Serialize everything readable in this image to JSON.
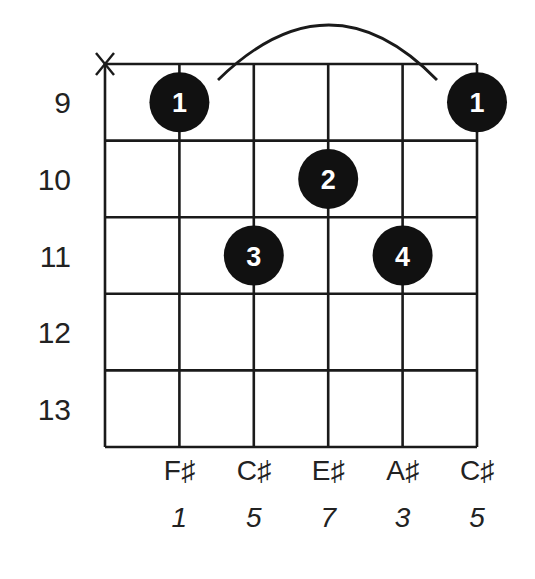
{
  "diagram": {
    "type": "guitar-chord-diagram",
    "strings": 6,
    "fret_rows": 5,
    "colors": {
      "ink": "#1a1a1a",
      "dot": "#111111",
      "dot_text": "#ffffff",
      "background": "#ffffff"
    },
    "fret_numbers": [
      "9",
      "10",
      "11",
      "12",
      "13"
    ],
    "muted_strings": [
      1
    ],
    "muted_symbol": "X",
    "barre": {
      "from_string": 2,
      "to_string": 6,
      "fret_row": 1
    },
    "fingers": [
      {
        "string": 2,
        "fret_row": 1,
        "label": "1"
      },
      {
        "string": 6,
        "fret_row": 1,
        "label": "1"
      },
      {
        "string": 4,
        "fret_row": 2,
        "label": "2"
      },
      {
        "string": 3,
        "fret_row": 3,
        "label": "3"
      },
      {
        "string": 5,
        "fret_row": 3,
        "label": "4"
      }
    ],
    "notes": [
      "F♯",
      "C♯",
      "E♯",
      "A♯",
      "C♯"
    ],
    "degrees": [
      "1",
      "5",
      "7",
      "3",
      "5"
    ]
  }
}
